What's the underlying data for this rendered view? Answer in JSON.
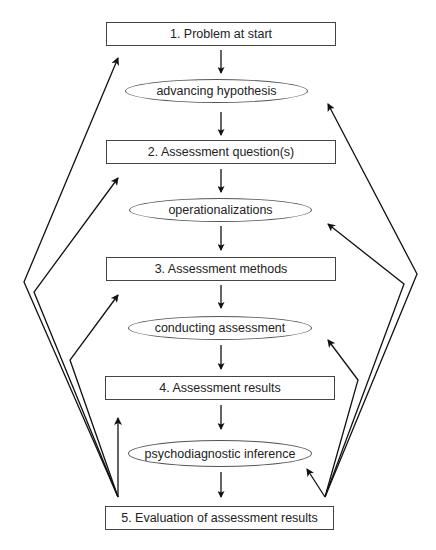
{
  "diagram": {
    "type": "flowchart",
    "steps": [
      {
        "label": "1. Problem at start",
        "shape": "rectangle"
      },
      {
        "label": "advancing hypothesis",
        "shape": "ellipse"
      },
      {
        "label": "2. Assessment question(s)",
        "shape": "rectangle"
      },
      {
        "label": "operationalizations",
        "shape": "ellipse"
      },
      {
        "label": "3. Assessment methods",
        "shape": "rectangle"
      },
      {
        "label": "conducting assessment",
        "shape": "ellipse"
      },
      {
        "label": "4. Assessment results",
        "shape": "rectangle"
      },
      {
        "label": "psychodiagnostic inference",
        "shape": "ellipse"
      },
      {
        "label": "5. Evaluation of assessment results",
        "shape": "rectangle"
      }
    ],
    "feedback_arrows": {
      "left_targets": [
        "1. Problem at start",
        "2. Assessment question(s)",
        "3. Assessment methods",
        "4. Assessment results"
      ],
      "right_targets": [
        "advancing hypothesis",
        "operationalizations",
        "conducting assessment",
        "psychodiagnostic inference"
      ],
      "source": "5. Evaluation of assessment results"
    },
    "line_color": "#111111"
  }
}
